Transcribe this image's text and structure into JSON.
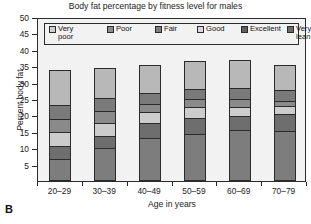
{
  "panel_label": "B",
  "chart_data": {
    "type": "bar",
    "subtype": "stacked-column",
    "title": "Body fat percentage by fitness level for males",
    "xlabel": "Age in years",
    "ylabel": "Percent body fat",
    "categories": [
      "20–29",
      "30–39",
      "40–49",
      "50–59",
      "60–69",
      "70–79"
    ],
    "ylim": [
      0,
      50
    ],
    "yticks": [
      5,
      10,
      15,
      20,
      25,
      30,
      35,
      40,
      45,
      50
    ],
    "grid": false,
    "legend_position": "top-inside",
    "series": [
      {
        "name": "Very lean",
        "color": "#7d7d7d",
        "values": [
          6.5,
          9.8,
          12.8,
          14.0,
          15.3,
          15.0
        ]
      },
      {
        "name": "Excellent",
        "color": "#6e6e6e",
        "values": [
          10.3,
          13.5,
          17.3,
          19.0,
          19.5,
          20.2
        ]
      },
      {
        "name": "Good",
        "color": "#cccccc",
        "values": [
          14.5,
          17.5,
          20.8,
          22.2,
          22.2,
          22.6
        ]
      },
      {
        "name": "Fair",
        "color": "#8a8a8a",
        "values": [
          18.7,
          21.0,
          23.2,
          24.6,
          24.8,
          24.2
        ]
      },
      {
        "name": "Poor",
        "color": "#7a7a7a",
        "values": [
          23.0,
          24.9,
          26.6,
          27.8,
          28.2,
          27.3
        ]
      },
      {
        "name": "Very poor",
        "color": "#b8b8b8",
        "values": [
          33.4,
          34.2,
          35.0,
          36.2,
          36.5,
          35.2
        ]
      }
    ],
    "legend": [
      {
        "label": "Very poor",
        "color": "#cfcfcf"
      },
      {
        "label": "Poor",
        "color": "#8c8c8c"
      },
      {
        "label": "Fair",
        "color": "#7f7f7f"
      },
      {
        "label": "Good",
        "color": "#d9d9d9"
      },
      {
        "label": "Excellent",
        "color": "#5f5f5f"
      },
      {
        "label": "Very lean",
        "color": "#6b6b6b"
      }
    ]
  }
}
